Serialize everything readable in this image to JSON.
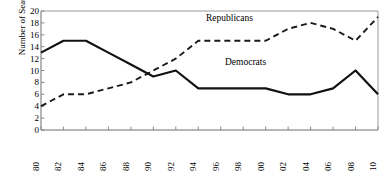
{
  "chart_data": {
    "type": "line",
    "title": "",
    "xlabel": "",
    "ylabel": "Number of Seats",
    "x": [
      1980,
      1982,
      1984,
      1986,
      1988,
      1990,
      1992,
      1994,
      1996,
      1998,
      2000,
      2002,
      2004,
      2006,
      2008,
      2010
    ],
    "xtick_labels": [
      "1980",
      "1982",
      "1984",
      "1986",
      "1988",
      "1990",
      "1992",
      "1994",
      "1996",
      "1998",
      "2000",
      "2002",
      "2004",
      "2006",
      "2008",
      "2010"
    ],
    "ytick_labels": [
      "0",
      "2",
      "4",
      "6",
      "8",
      "10",
      "12",
      "14",
      "16",
      "18",
      "20"
    ],
    "yticks": [
      0,
      2,
      4,
      6,
      8,
      10,
      12,
      14,
      16,
      18,
      20
    ],
    "ylim": [
      0,
      20
    ],
    "xlim": [
      1980,
      2010
    ],
    "grid": false,
    "legend_position": "inline-annotation",
    "series": [
      {
        "name": "Democrats",
        "style": "solid",
        "color": "#000000",
        "values": [
          13,
          15,
          15,
          13,
          11,
          9,
          10,
          7,
          7,
          7,
          7,
          6,
          6,
          7,
          10,
          6
        ]
      },
      {
        "name": "Republicans",
        "style": "dashed",
        "color": "#000000",
        "values": [
          4,
          6,
          6,
          7,
          8,
          10,
          12,
          15,
          15,
          15,
          15,
          17,
          18,
          17,
          15,
          19
        ]
      }
    ],
    "annotations": [
      {
        "text": "Republicans",
        "series": "Republicans"
      },
      {
        "text": "Democrats",
        "series": "Democrats"
      }
    ]
  }
}
